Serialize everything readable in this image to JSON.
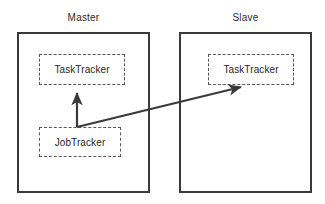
{
  "diagram": {
    "background_color": "#ffffff",
    "outer_border_color": "#3a3a3a",
    "inner_border_color": "#555555",
    "text_color": "#1f1f1f",
    "arrow_color": "#3a3a3a",
    "groups": [
      {
        "id": "master",
        "label": "Master",
        "border_style": "solid",
        "nodes": [
          {
            "id": "master-tasktracker",
            "label": "TaskTracker",
            "border_style": "dashed"
          },
          {
            "id": "master-jobtracker",
            "label": "JobTracker",
            "border_style": "dashed"
          }
        ]
      },
      {
        "id": "slave",
        "label": "Slave",
        "border_style": "solid",
        "nodes": [
          {
            "id": "slave-tasktracker",
            "label": "TaskTracker",
            "border_style": "dashed"
          }
        ]
      }
    ],
    "connections": [
      {
        "id": "jobtracker-to-master-tasktracker",
        "from": "master-jobtracker",
        "to": "master-tasktracker",
        "style": "solid-arrow",
        "direction": "up",
        "label": ""
      },
      {
        "id": "jobtracker-to-slave-tasktracker",
        "from": "master-jobtracker",
        "to": "slave-tasktracker",
        "style": "solid-arrow",
        "direction": "up-right",
        "label": ""
      }
    ]
  }
}
